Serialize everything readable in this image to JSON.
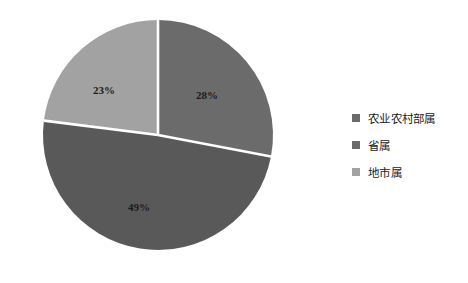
{
  "chart_data": {
    "type": "pie",
    "title": "",
    "categories": [
      "农业农村部属",
      "省属",
      "地市属"
    ],
    "values": [
      28,
      49,
      23
    ],
    "value_labels": [
      "28%",
      "49%",
      "23%"
    ],
    "unit": "%",
    "colors": [
      "#6b6b6b",
      "#595959",
      "#a2a2a2"
    ],
    "legend_position": "right",
    "start_angle_deg": 0,
    "direction": "clockwise",
    "slice_separator_color": "#ffffff",
    "background": "#ffffff"
  },
  "pie": {
    "slices": [
      {
        "name": "农业农村部属",
        "label": "28%",
        "value": 28,
        "color": "#6b6b6b",
        "label_x": 207,
        "label_y": 95
      },
      {
        "name": "省属",
        "label": "49%",
        "value": 49,
        "color": "#595959",
        "label_x": 139,
        "label_y": 207
      },
      {
        "name": "地市属",
        "label": "23%",
        "value": 23,
        "color": "#a2a2a2",
        "label_x": 104,
        "label_y": 90
      }
    ]
  },
  "legend": {
    "items": [
      {
        "label": "农业农村部属",
        "color": "#6b6b6b"
      },
      {
        "label": "省属",
        "color": "#6b6b6b"
      },
      {
        "label": "地市属",
        "color": "#a2a2a2"
      }
    ]
  }
}
